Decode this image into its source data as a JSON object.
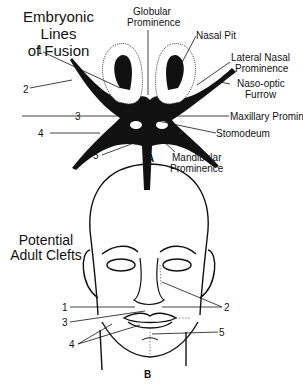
{
  "panel_a": {
    "title_line1": "Embryonic Lines",
    "title_line2": "of Fusion",
    "letter": "A",
    "labels": {
      "globular_1": "Globular",
      "globular_2": "Prominence",
      "nasal_pit": "Nasal Pit",
      "lateral_nasal_1": "Lateral Nasal",
      "lateral_nasal_2": "Prominence",
      "naso_optic_1": "Naso-optic",
      "naso_optic_2": "Furrow",
      "maxillary": "Maxillary Prominence",
      "stomodeum": "Stomodeum",
      "mandibular_1": "Mandibular",
      "mandibular_2": "Prominence"
    },
    "numbers": [
      "1",
      "2",
      "3",
      "4",
      "5"
    ]
  },
  "panel_b": {
    "title_line1": "Potential",
    "title_line2": "Adult Clefts",
    "letter": "B",
    "numbers": [
      "1",
      "2",
      "3",
      "4",
      "5"
    ]
  }
}
